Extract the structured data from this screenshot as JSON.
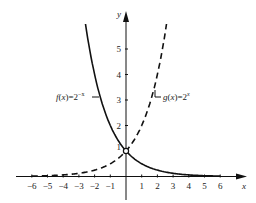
{
  "chart_data": {
    "type": "line",
    "title": "",
    "xlabel": "x",
    "ylabel": "y",
    "xlim": [
      -6.5,
      7.5
    ],
    "ylim": [
      -0.4,
      6.5
    ],
    "grid": false,
    "x_ticks": [
      -6,
      -5,
      -4,
      -3,
      -2,
      -1,
      1,
      2,
      3,
      4,
      5,
      6
    ],
    "y_ticks": [
      1,
      2,
      3,
      4,
      5
    ],
    "series": [
      {
        "name": "f(x)=2^-x",
        "label": "f(x)=2⁻ˣ",
        "style": "solid",
        "formula": "2^-x",
        "x": [
          -2.58,
          -2,
          -1,
          0,
          1,
          2,
          3,
          4,
          5,
          6
        ],
        "values": [
          6.0,
          4.0,
          2.0,
          1.0,
          0.5,
          0.25,
          0.125,
          0.0625,
          0.03125,
          0.015625
        ]
      },
      {
        "name": "g(x)=2^x",
        "label": "g(x)=2ˣ",
        "style": "dashed",
        "formula": "2^x",
        "x": [
          -6,
          -5,
          -4,
          -3,
          -2,
          -1,
          0,
          1,
          2,
          2.58
        ],
        "values": [
          0.015625,
          0.03125,
          0.0625,
          0.125,
          0.25,
          0.5,
          1.0,
          2.0,
          4.0,
          6.0
        ]
      }
    ],
    "annotations": [
      {
        "type": "open-circle",
        "x": 0,
        "y": 1,
        "text": "1"
      }
    ]
  },
  "labels": {
    "x_axis": "x",
    "y_axis": "y",
    "f_label": "f(x)=2⁻ˣ",
    "g_label": "g(x)=2ˣ",
    "intercept": "1"
  }
}
